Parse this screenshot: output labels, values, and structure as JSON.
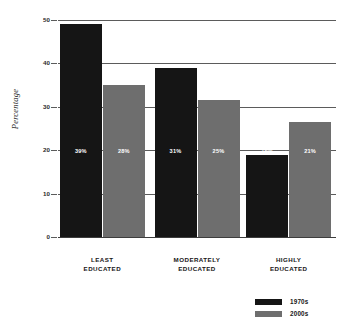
{
  "chart_data": {
    "type": "bar",
    "title": "",
    "xlabel": "",
    "ylabel": "Percentage",
    "ylim": [
      0,
      50
    ],
    "yticks": [
      0,
      10,
      20,
      30,
      40,
      50
    ],
    "ytick_labels": [
      "0",
      "10",
      "20",
      "30",
      "40",
      "50"
    ],
    "grid": true,
    "legend_position": "bottom-right",
    "categories": [
      "LEAST EDUCATED",
      "MODERATELY EDUCATED",
      "HIGHLY EDUCATED"
    ],
    "category_lines": [
      [
        "LEAST",
        "EDUCATED"
      ],
      [
        "MODERATELY",
        "EDUCATED"
      ],
      [
        "HIGHLY",
        "EDUCATED"
      ]
    ],
    "series": [
      {
        "name": "1970s",
        "color": "#151515",
        "values": [
          49,
          39,
          19
        ],
        "data_labels": [
          "39%",
          "31%",
          "15%"
        ]
      },
      {
        "name": "2000s",
        "color": "#6e6e6e",
        "values": [
          35,
          31.5,
          26.5
        ],
        "data_labels": [
          "28%",
          "25%",
          "21%"
        ]
      }
    ]
  },
  "axis": {
    "y_title": "Percentage"
  },
  "legend": {
    "items": [
      {
        "label": "1970s",
        "color": "#151515"
      },
      {
        "label": "2000s",
        "color": "#6e6e6e"
      }
    ]
  }
}
